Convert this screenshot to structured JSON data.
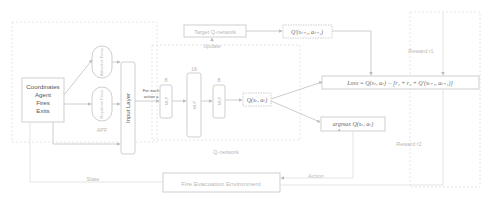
{
  "diagram": {
    "input_box": {
      "lines": [
        "Coordinates",
        "Agent",
        "Fires",
        "Exits"
      ]
    },
    "apf": {
      "label": "APF",
      "ovals": [
        "Attractive Force",
        "Repulsive Force"
      ]
    },
    "input_layer": {
      "label": "Input Layer"
    },
    "for_each_action": {
      "lines": [
        "For each",
        "action a"
      ]
    },
    "q_network": {
      "label": "Q-network",
      "layers": [
        {
          "size": "8",
          "text": "MLP"
        },
        {
          "size": "16",
          "text": "MLP"
        },
        {
          "size": "8",
          "text": "MLP"
        }
      ],
      "output": "Q(sₜ, aₜ)"
    },
    "target_network": {
      "label": "Target Q-network",
      "update_label": "Update",
      "output": "Q′(sₜ₊₁, aₜ₊₁)"
    },
    "loss": {
      "text": "Loss = Q(sₜ, aₜ) − [r₁ + r₂ + Q′(sₜ₊₁, aₜ₊₁)]"
    },
    "argmax": {
      "text": "argmax Q(sₜ, aₜ)",
      "subscript": "a"
    },
    "rewards": {
      "r1": "Reward r1",
      "r2": "Reward r2"
    },
    "environment": {
      "label": "Fire Evacuation Environment"
    },
    "edges": {
      "state": "State",
      "action": "Action"
    }
  }
}
